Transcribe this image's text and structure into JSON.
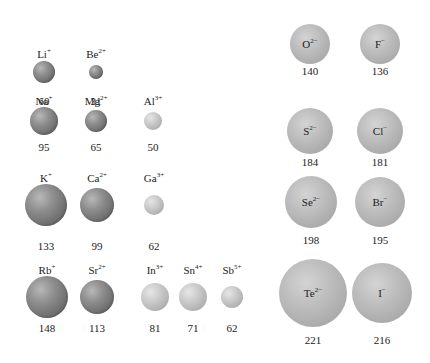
{
  "colors": {
    "cation_dark": "#7a7a7a",
    "cation_light": "#c4c4c4",
    "anion": "#b6b6b6",
    "text": "#222222"
  },
  "cations": [
    {
      "symbol": "Li",
      "charge": "+",
      "radius": "60",
      "cx": 44,
      "cy": 72,
      "r": 11,
      "shade": "dark",
      "label_y": 48,
      "value_y": 95
    },
    {
      "symbol": "Be",
      "charge": "2+",
      "radius": "31",
      "cx": 96,
      "cy": 72,
      "r": 7,
      "shade": "dark",
      "label_y": 48,
      "value_y": 95
    },
    {
      "symbol": "Na",
      "charge": "+",
      "radius": "95",
      "cx": 44,
      "cy": 121,
      "r": 14,
      "shade": "dark",
      "label_y": 95,
      "value_y": 141
    },
    {
      "symbol": "Mg",
      "charge": "2+",
      "radius": "65",
      "cx": 96,
      "cy": 121,
      "r": 11,
      "shade": "dark",
      "label_y": 95,
      "value_y": 141
    },
    {
      "symbol": "Al",
      "charge": "3+",
      "radius": "50",
      "cx": 153,
      "cy": 121,
      "r": 9,
      "shade": "light",
      "label_y": 95,
      "value_y": 141
    },
    {
      "symbol": "K",
      "charge": "+",
      "radius": "133",
      "cx": 46,
      "cy": 205,
      "r": 21,
      "shade": "dark",
      "label_y": 172,
      "value_y": 240
    },
    {
      "symbol": "Ca",
      "charge": "2+",
      "radius": "99",
      "cx": 97,
      "cy": 205,
      "r": 17,
      "shade": "dark",
      "label_y": 172,
      "value_y": 240
    },
    {
      "symbol": "Ga",
      "charge": "3+",
      "radius": "62",
      "cx": 154,
      "cy": 205,
      "r": 10,
      "shade": "light",
      "label_y": 172,
      "value_y": 240
    },
    {
      "symbol": "Rb",
      "charge": "+",
      "radius": "148",
      "cx": 47,
      "cy": 297,
      "r": 21,
      "shade": "dark",
      "label_y": 264,
      "value_y": 322
    },
    {
      "symbol": "Sr",
      "charge": "2+",
      "radius": "113",
      "cx": 97,
      "cy": 297,
      "r": 17,
      "shade": "dark",
      "label_y": 264,
      "value_y": 322
    },
    {
      "symbol": "In",
      "charge": "3+",
      "radius": "81",
      "cx": 155,
      "cy": 297,
      "r": 14,
      "shade": "light",
      "label_y": 264,
      "value_y": 322
    },
    {
      "symbol": "Sn",
      "charge": "4+",
      "radius": "71",
      "cx": 193,
      "cy": 297,
      "r": 14,
      "shade": "light",
      "label_y": 264,
      "value_y": 322
    },
    {
      "symbol": "Sb",
      "charge": "5+",
      "radius": "62",
      "cx": 232,
      "cy": 297,
      "r": 11,
      "shade": "light",
      "label_y": 264,
      "value_y": 322
    }
  ],
  "anions": [
    {
      "symbol": "O",
      "charge": "2−",
      "radius": "140",
      "cx": 310,
      "cy": 44,
      "r": 20,
      "value_y": 65
    },
    {
      "symbol": "F",
      "charge": "−",
      "radius": "136",
      "cx": 380,
      "cy": 44,
      "r": 20,
      "value_y": 65
    },
    {
      "symbol": "S",
      "charge": "2−",
      "radius": "184",
      "cx": 310,
      "cy": 131,
      "r": 23,
      "value_y": 156
    },
    {
      "symbol": "Cl",
      "charge": "−",
      "radius": "181",
      "cx": 380,
      "cy": 131,
      "r": 23,
      "value_y": 156
    },
    {
      "symbol": "Se",
      "charge": "2−",
      "radius": "198",
      "cx": 311,
      "cy": 202,
      "r": 26,
      "value_y": 234
    },
    {
      "symbol": "Br",
      "charge": "−",
      "radius": "195",
      "cx": 380,
      "cy": 202,
      "r": 25,
      "value_y": 234
    },
    {
      "symbol": "Te",
      "charge": "2−",
      "radius": "221",
      "cx": 313,
      "cy": 293,
      "r": 34,
      "value_y": 334
    },
    {
      "symbol": "I",
      "charge": "−",
      "radius": "216",
      "cx": 382,
      "cy": 293,
      "r": 30,
      "value_y": 334
    }
  ]
}
